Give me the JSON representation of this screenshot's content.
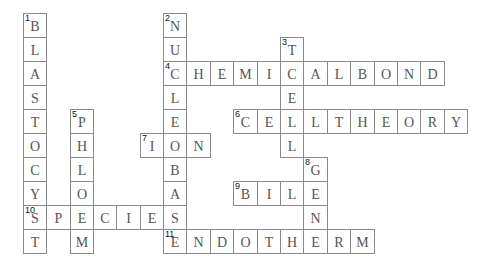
{
  "puzzle": {
    "type": "crossword",
    "grid_origin": {
      "x": 22.7,
      "y": 13
    },
    "cell_size": {
      "w": 23.4,
      "h": 24
    },
    "entries": [
      {
        "number": 1,
        "direction": "down",
        "answer": "BLASTOCYST",
        "row": 0,
        "col": 0
      },
      {
        "number": 2,
        "direction": "down",
        "answer": "NUCLEOBASE",
        "row": 0,
        "col": 6
      },
      {
        "number": 3,
        "direction": "down",
        "answer": "TCELL",
        "row": 1,
        "col": 11
      },
      {
        "number": 4,
        "direction": "across",
        "answer": "CHEMICALBOND",
        "row": 2,
        "col": 6
      },
      {
        "number": 5,
        "direction": "down",
        "answer": "PHLOEM",
        "row": 4,
        "col": 2
      },
      {
        "number": 6,
        "direction": "across",
        "answer": "CELLTHEORY",
        "row": 4,
        "col": 9
      },
      {
        "number": 7,
        "direction": "across",
        "answer": "ION",
        "row": 5,
        "col": 5
      },
      {
        "number": 8,
        "direction": "down",
        "answer": "GENE",
        "row": 6,
        "col": 12
      },
      {
        "number": 9,
        "direction": "across",
        "answer": "BILE",
        "row": 7,
        "col": 9
      },
      {
        "number": 10,
        "direction": "across",
        "answer": "SPECIES",
        "row": 8,
        "col": 0
      },
      {
        "number": 11,
        "direction": "across",
        "answer": "ENDOTHERM",
        "row": 9,
        "col": 6
      }
    ]
  },
  "colors": {
    "border": "#8a8a8a",
    "letter": "#555555",
    "number": "#111111",
    "background": "#ffffff"
  }
}
